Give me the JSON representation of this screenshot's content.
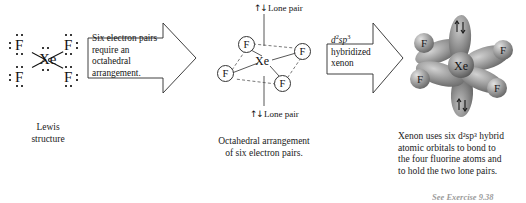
{
  "figure": {
    "exercise_note": "See Exercise 9.38"
  },
  "lewis": {
    "center_atom": "Xe",
    "ligands": [
      "F",
      "F",
      "F",
      "F"
    ],
    "caption_line1": "Lewis",
    "caption_line2": "structure"
  },
  "arrow1": {
    "line1": "Six electron pairs",
    "line2": "require an octahedral",
    "line3": "arrangement."
  },
  "octahedral": {
    "center_atom": "Xe",
    "ligands": [
      "F",
      "F",
      "F",
      "F"
    ],
    "lone_pair_top_spin": "↑↓",
    "lone_pair_top_label": "Lone pair",
    "lone_pair_bottom_spin": "↑↓",
    "lone_pair_bottom_label": "Lone pair",
    "caption_line1": "Octahedral arrangement",
    "caption_line2": "of six electron pairs."
  },
  "arrow2": {
    "hybrid_d": "d",
    "hybrid_d_sup": "2",
    "hybrid_sp": "sp",
    "hybrid_sp_sup": "3",
    "line2": "hybridized",
    "line3": "xenon"
  },
  "model": {
    "center_atom": "Xe",
    "ligands": [
      "F",
      "F",
      "F",
      "F"
    ],
    "lone_pair_top_spin": "↑↓",
    "lone_pair_bottom_spin": "↑↓",
    "caption_line1": "Xenon uses six d²sp³ hybrid",
    "caption_line2": "atomic orbitals to bond to",
    "caption_line3": "the four fluorine atoms and",
    "caption_line4": "to hold the two lone pairs."
  },
  "colors": {
    "ink": "#1a1a1a",
    "outline": "#333333",
    "lobe_dark": "#6e6e6e",
    "lobe_light": "#d8d8d8",
    "sphere": "#9a9a9a",
    "background": "#ffffff"
  }
}
